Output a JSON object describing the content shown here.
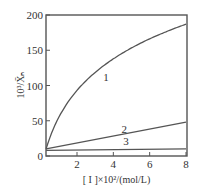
{
  "chart_data": {
    "type": "line",
    "title": "",
    "xlabel": "[ I ]×10²/(mol/L)",
    "ylabel": "10³/X̄ₙ",
    "xlim": [
      0.3,
      8
    ],
    "ylim": [
      0,
      200
    ],
    "grid": false,
    "legend": "inline numeric labels",
    "x_ticks": [
      2,
      4,
      6,
      8
    ],
    "y_ticks": [
      0,
      50,
      100,
      150,
      200
    ],
    "series": [
      {
        "name": "1",
        "x": [
          0.3,
          0.5,
          1,
          1.5,
          2,
          3,
          4,
          5,
          6,
          7,
          8
        ],
        "values": [
          10,
          30,
          55,
          72,
          87,
          110,
          130,
          147,
          162,
          175,
          187
        ]
      },
      {
        "name": "2",
        "x": [
          0.3,
          8
        ],
        "values": [
          10,
          48
        ]
      },
      {
        "name": "3",
        "x": [
          0.3,
          8
        ],
        "values": [
          8,
          10
        ]
      }
    ]
  },
  "labels": {
    "x_axis": "[ I ]×10²/(mol/L)",
    "y_axis_base": "10³/",
    "y_axis_var": "X̄ₙ",
    "y_ticks": [
      "0",
      "50",
      "100",
      "150",
      "200"
    ],
    "x_ticks": [
      "2",
      "4",
      "6",
      "8"
    ],
    "series": [
      "1",
      "2",
      "3"
    ]
  }
}
